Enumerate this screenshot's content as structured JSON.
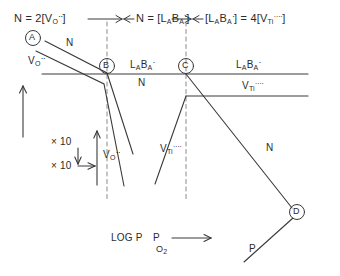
{
  "figure": {
    "type": "brouwer-diagram",
    "title": "",
    "x_axis_label": "LOG P",
    "x_axis_sub": "O",
    "x_axis_sub2": "2",
    "regions": [
      {
        "id": "region-1",
        "label_parts": {
          "lhs": "N = 2[V",
          "sub": "O",
          "sup": "··",
          "rhs": "]"
        },
        "plain": "N = 2[V_O^··]"
      },
      {
        "id": "region-2",
        "label_parts": {
          "lhs": "N = [L",
          "sub_a": "A",
          "mid": "B",
          "sub_b": "A",
          "sup": "·",
          "rhs": "]"
        },
        "plain": "N = [L_A B_A^·]"
      },
      {
        "id": "region-3",
        "label_parts": {
          "lhs": "[L",
          "sub_a": "A",
          "mid": "B",
          "sub_b": "A",
          "sup": "·",
          "eq": "] = 4[V",
          "sub_c": "Ti",
          "sup2": "····",
          "rhs": "]"
        },
        "plain": "[L_A B_A^·] = 4[V_Ti^····]"
      }
    ],
    "vertices": [
      {
        "name": "A",
        "label": "A",
        "x": 33,
        "y": 38
      },
      {
        "name": "B",
        "label": "B",
        "x": 107,
        "y": 66
      },
      {
        "name": "C",
        "label": "C",
        "x": 186,
        "y": 66
      },
      {
        "name": "D",
        "label": "D",
        "x": 297,
        "y": 212
      }
    ],
    "curve_labels": [
      {
        "name": "n-left",
        "text": "N"
      },
      {
        "name": "vo-left",
        "text": "V",
        "sub": "O",
        "sup": "··"
      },
      {
        "name": "lb-mid",
        "text": "L",
        "sub_a": "A",
        "mid": "B",
        "sub_b": "A",
        "sup": "·"
      },
      {
        "name": "n-mid",
        "text": "N"
      },
      {
        "name": "vo-mid",
        "text": "V",
        "sub": "O",
        "sup": "··"
      },
      {
        "name": "lb-right",
        "text": "L",
        "sub_a": "A",
        "mid": "B",
        "sub_b": "A",
        "sup": "·"
      },
      {
        "name": "vti-right",
        "text": "V",
        "sub": "Ti",
        "sup": "····"
      },
      {
        "name": "vti-mid",
        "text": "V",
        "sub": "Ti",
        "sup": "····"
      },
      {
        "name": "n-right",
        "text": "N"
      },
      {
        "name": "p-right",
        "text": "P"
      }
    ],
    "scale_markers": [
      {
        "name": "scale-vertical",
        "text": "× 10"
      },
      {
        "name": "scale-horizontal",
        "text": "× 10"
      }
    ],
    "colors": {
      "line": "#3a3a3a",
      "dashed": "#8a8a8a",
      "text": "#2b2b2b",
      "background": "#ffffff"
    }
  }
}
